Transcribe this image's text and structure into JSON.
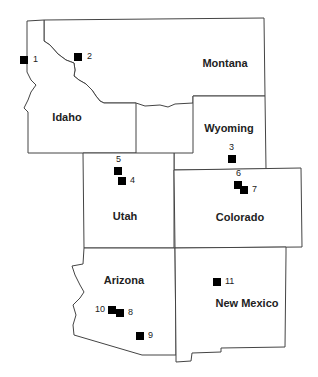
{
  "map": {
    "states": [
      {
        "name": "Montana",
        "label": "Montana",
        "label_x": 225,
        "label_y": 63
      },
      {
        "name": "Idaho",
        "label": "Idaho",
        "label_x": 67,
        "label_y": 117
      },
      {
        "name": "Wyoming",
        "label": "Wyoming",
        "label_x": 229,
        "label_y": 128
      },
      {
        "name": "Utah",
        "label": "Utah",
        "label_x": 125,
        "label_y": 216
      },
      {
        "name": "Colorado",
        "label": "Colorado",
        "label_x": 240,
        "label_y": 217
      },
      {
        "name": "Arizona",
        "label": "Arizona",
        "label_x": 124,
        "label_y": 280
      },
      {
        "name": "New Mexico",
        "label": "New Mexico",
        "label_x": 247,
        "label_y": 303
      }
    ],
    "sites": [
      {
        "id": "1",
        "x": 24,
        "y": 60,
        "label_dx": 12,
        "label_dy": 0
      },
      {
        "id": "2",
        "x": 78,
        "y": 57,
        "label_dx": 12,
        "label_dy": 0
      },
      {
        "id": "3",
        "x": 232,
        "y": 159,
        "label_dx": 0,
        "label_dy": -11
      },
      {
        "id": "4",
        "x": 122,
        "y": 181,
        "label_dx": 11,
        "label_dy": 0
      },
      {
        "id": "5",
        "x": 118,
        "y": 171,
        "label_dx": 1,
        "label_dy": -11
      },
      {
        "id": "6",
        "x": 238,
        "y": 185,
        "label_dx": 1,
        "label_dy": -11
      },
      {
        "id": "7",
        "x": 244,
        "y": 190,
        "label_dx": 11,
        "label_dy": 0
      },
      {
        "id": "8",
        "x": 120,
        "y": 313,
        "label_dx": 11,
        "label_dy": 0
      },
      {
        "id": "9",
        "x": 140,
        "y": 336,
        "label_dx": 11,
        "label_dy": 0
      },
      {
        "id": "10",
        "x": 112,
        "y": 310,
        "label_dx": -14,
        "label_dy": 0
      },
      {
        "id": "11",
        "x": 217,
        "y": 282,
        "label_dx": 11,
        "label_dy": 0
      }
    ]
  }
}
